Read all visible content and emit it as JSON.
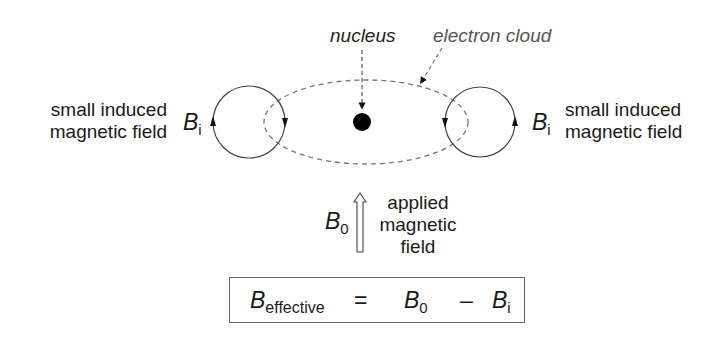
{
  "labels": {
    "nucleus": "nucleus",
    "electron_cloud": "electron cloud",
    "left_field_line1": "small induced",
    "left_field_line2": "magnetic field",
    "right_field_line1": "small induced",
    "right_field_line2": "magnetic field",
    "applied_line1": "applied",
    "applied_line2": "magnetic",
    "applied_line3": "field"
  },
  "symbols": {
    "B": "B",
    "induced_sub": "i",
    "applied_sub": "0",
    "effective_sub": "effective"
  },
  "equation": {
    "lhs_base": "B",
    "lhs_sub": "effective",
    "equals": "=",
    "term1_base": "B",
    "term1_sub": "0",
    "minus": "–",
    "term2_base": "B",
    "term2_sub": "i"
  },
  "colors": {
    "line": "#333333",
    "dashed": "#777777",
    "nucleus": "#000000"
  }
}
